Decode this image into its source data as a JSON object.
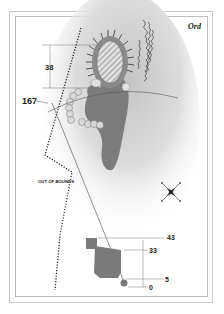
{
  "hole": {
    "name": "Ord"
  },
  "labels": {
    "out_of_bounds": "OUT OF BOUNDS"
  },
  "distances": {
    "green_depth": "38",
    "carry": "167",
    "tee_markers": [
      "43",
      "33",
      "5",
      "0"
    ]
  },
  "colors": {
    "fairway_shade": "#c8c8c8",
    "green": "#7a7a7a",
    "putting_surface": "#d4d4d4",
    "tee": "#7a7a7a",
    "bunker": "#e0e0e0",
    "line": "#555555"
  }
}
